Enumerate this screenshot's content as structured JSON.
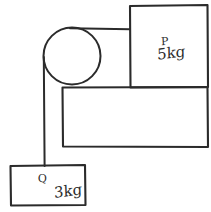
{
  "diagram": {
    "background_color": "#ffffff",
    "ink_color": "#2b2b2b",
    "blocks": {
      "p": {
        "name": "P",
        "mass": "5kg",
        "position": "on table, right side"
      },
      "q": {
        "name": "Q",
        "mass": "3kg",
        "position": "hanging, bottom left"
      }
    },
    "pulley": {
      "label": "pulley"
    },
    "string": {
      "label": "string"
    },
    "table": {
      "label": "table"
    }
  }
}
